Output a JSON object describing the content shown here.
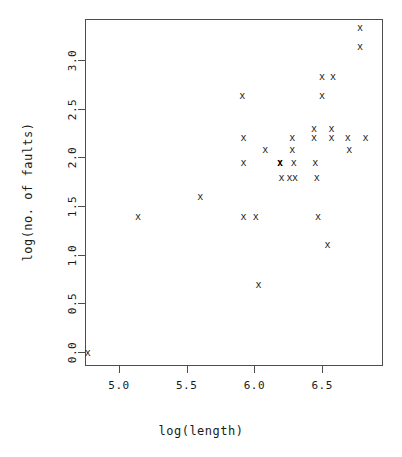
{
  "chart_data": {
    "type": "scatter",
    "title": "",
    "xlabel": "log(length)",
    "ylabel": "log(no. of faults)",
    "marker": "x",
    "grid": false,
    "legend": null,
    "xlim": [
      4.72,
      6.92
    ],
    "ylim": [
      -0.08,
      3.46
    ],
    "xticks": [
      "5.0",
      "5.5",
      "6.0",
      "6.5"
    ],
    "xtick_values": [
      5.0,
      5.5,
      6.0,
      6.5
    ],
    "yticks": [
      "0.0",
      "0.5",
      "1.0",
      "1.5",
      "2.0",
      "2.5",
      "3.0"
    ],
    "ytick_values": [
      0.0,
      0.5,
      1.0,
      1.5,
      2.0,
      2.5,
      3.0
    ],
    "points": [
      {
        "x": 4.77,
        "y": 0.0
      },
      {
        "x": 5.14,
        "y": 1.39
      },
      {
        "x": 5.6,
        "y": 1.6
      },
      {
        "x": 5.91,
        "y": 2.64
      },
      {
        "x": 5.92,
        "y": 2.2
      },
      {
        "x": 5.92,
        "y": 1.95
      },
      {
        "x": 5.92,
        "y": 1.39
      },
      {
        "x": 6.01,
        "y": 1.39
      },
      {
        "x": 6.03,
        "y": 0.69
      },
      {
        "x": 6.08,
        "y": 2.08
      },
      {
        "x": 6.19,
        "y": 1.95
      },
      {
        "x": 6.19,
        "y": 1.95
      },
      {
        "x": 6.2,
        "y": 1.79
      },
      {
        "x": 6.26,
        "y": 1.79
      },
      {
        "x": 6.28,
        "y": 2.2
      },
      {
        "x": 6.28,
        "y": 2.08
      },
      {
        "x": 6.29,
        "y": 1.95
      },
      {
        "x": 6.3,
        "y": 1.79
      },
      {
        "x": 6.44,
        "y": 2.3
      },
      {
        "x": 6.44,
        "y": 2.2
      },
      {
        "x": 6.45,
        "y": 1.95
      },
      {
        "x": 6.46,
        "y": 1.79
      },
      {
        "x": 6.47,
        "y": 1.39
      },
      {
        "x": 6.5,
        "y": 2.83
      },
      {
        "x": 6.5,
        "y": 2.64
      },
      {
        "x": 6.54,
        "y": 1.1
      },
      {
        "x": 6.57,
        "y": 2.3
      },
      {
        "x": 6.57,
        "y": 2.2
      },
      {
        "x": 6.58,
        "y": 2.83
      },
      {
        "x": 6.69,
        "y": 2.2
      },
      {
        "x": 6.7,
        "y": 2.08
      },
      {
        "x": 6.78,
        "y": 3.33
      },
      {
        "x": 6.78,
        "y": 3.14
      },
      {
        "x": 6.82,
        "y": 2.2
      }
    ],
    "overplotted": [
      {
        "x": 6.19,
        "y": 1.95,
        "count": 2
      }
    ]
  }
}
